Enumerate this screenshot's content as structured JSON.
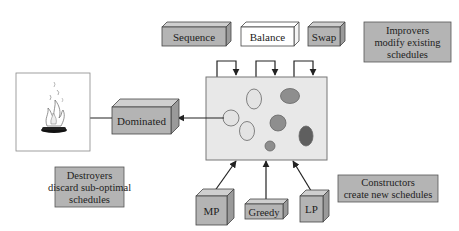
{
  "improvers": {
    "operators": [
      "Sequence",
      "Balance",
      "Swap"
    ],
    "note_lines": [
      "Improvers",
      "modify existing",
      "schedules"
    ]
  },
  "destroyers": {
    "operator": "Dominated",
    "note_lines": [
      "Destroyers",
      "discard sub-optimal",
      "schedules"
    ],
    "sink_icon": "campfire-icon"
  },
  "constructors": {
    "operators": [
      "MP",
      "Greedy",
      "LP"
    ],
    "note_lines": [
      "Constructors",
      "create new schedules"
    ]
  },
  "population": {
    "label": "schedule population",
    "schedules": [
      {
        "shade": "light"
      },
      {
        "shade": "light"
      },
      {
        "shade": "light"
      },
      {
        "shade": "medium"
      },
      {
        "shade": "medium"
      },
      {
        "shade": "medium"
      },
      {
        "shade": "dark"
      }
    ]
  },
  "colors": {
    "box_fill": "#b4b4b4",
    "box_top": "#cfcfcf",
    "box_side": "#9a9a9a",
    "white_box": "#ffffff",
    "population_fill": "#e8e8e8",
    "light_schedule": "#e3e3e3",
    "medium_schedule": "#8e8e8e",
    "dark_schedule": "#5f5f5f",
    "stroke": "#333333"
  }
}
